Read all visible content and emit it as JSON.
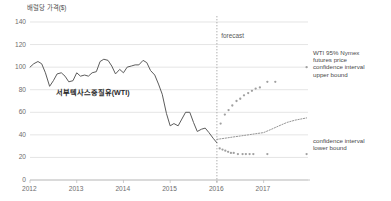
{
  "chart_data": {
    "type": "line",
    "title": "배럴당 가격($)",
    "xlabel": "",
    "ylabel": "배럴당 가격($)",
    "ylim": [
      0,
      140
    ],
    "yticks": [
      0,
      20,
      40,
      60,
      80,
      100,
      120,
      140
    ],
    "xlim": [
      2012.0,
      2017.95
    ],
    "xticks": [
      2012,
      2013,
      2014,
      2015,
      2016,
      2017
    ],
    "xticklabels": [
      "2012",
      "2013",
      "2014",
      "2015",
      "2016",
      "2017"
    ],
    "grid": true,
    "legend_position": "inline-annotations",
    "annotations": [
      {
        "name": "forecast-divider-label",
        "text": "forecast",
        "x": 2016.05,
        "y": 128
      },
      {
        "name": "wti-series-label",
        "text": "서부텍사스중질유(WTI)",
        "x": 2012.55,
        "y": 78
      },
      {
        "name": "upper-bound-label",
        "text": "WTI 95% Nymex\nfutures price\nconfidence interval\nupper bound",
        "x": 2018.05,
        "y": 104
      },
      {
        "name": "lower-bound-label",
        "text": "confidence interval\nlower bound",
        "x": 2018.05,
        "y": 26
      }
    ],
    "forecast_divider_x": 2016.0,
    "series": [
      {
        "name": "서부텍사스중질유(WTI)",
        "style": "solid-line",
        "color": "#5c5c5c",
        "x": [
          2012.0,
          2012.08,
          2012.17,
          2012.25,
          2012.33,
          2012.42,
          2012.5,
          2012.58,
          2012.67,
          2012.75,
          2012.83,
          2012.92,
          2013.0,
          2013.08,
          2013.17,
          2013.25,
          2013.33,
          2013.42,
          2013.5,
          2013.58,
          2013.67,
          2013.75,
          2013.83,
          2013.92,
          2014.0,
          2014.08,
          2014.17,
          2014.25,
          2014.33,
          2014.42,
          2014.5,
          2014.58,
          2014.67,
          2014.75,
          2014.83,
          2014.92,
          2015.0,
          2015.08,
          2015.17,
          2015.25,
          2015.33,
          2015.42,
          2015.5,
          2015.58,
          2015.67,
          2015.75,
          2015.83,
          2015.92,
          2016.0
        ],
        "values": [
          100,
          103,
          105,
          103,
          95,
          83,
          88,
          94,
          95,
          92,
          87,
          88,
          95,
          92,
          93,
          92,
          95,
          96,
          105,
          107,
          106,
          101,
          94,
          98,
          95,
          100,
          101,
          102,
          102,
          106,
          104,
          97,
          93,
          85,
          76,
          59,
          48,
          50,
          48,
          54,
          60,
          60,
          51,
          43,
          45,
          46,
          42,
          37,
          33
        ]
      },
      {
        "name": "WTI 95% Nymex futures price confidence interval upper bound",
        "style": "dots",
        "color": "#a0a0a0",
        "x": [
          2016.08,
          2016.17,
          2016.25,
          2016.33,
          2016.42,
          2016.5,
          2016.58,
          2016.67,
          2016.75,
          2016.83,
          2016.92,
          2017.08,
          2017.25,
          2017.92
        ],
        "values": [
          50,
          58,
          62,
          66,
          70,
          72,
          75,
          77,
          79,
          81,
          82,
          87,
          87,
          100
        ]
      },
      {
        "name": "confidence interval lower bound",
        "style": "dots",
        "color": "#a0a0a0",
        "x": [
          2016.06,
          2016.12,
          2016.18,
          2016.24,
          2016.3,
          2016.36,
          2016.45,
          2016.55,
          2016.62,
          2016.7,
          2016.78,
          2017.08,
          2017.92
        ],
        "values": [
          28,
          27,
          26,
          25,
          24,
          24,
          23,
          23,
          23,
          23,
          23,
          23,
          23
        ]
      },
      {
        "name": "central forecast",
        "style": "dotted-line",
        "color": "#8a8a8a",
        "x": [
          2016.0,
          2016.17,
          2016.33,
          2016.5,
          2016.67,
          2016.83,
          2017.0,
          2017.17,
          2017.33,
          2017.5,
          2017.67,
          2017.92
        ],
        "values": [
          36,
          37,
          38,
          39,
          40,
          41,
          42,
          45,
          48,
          51,
          53,
          55
        ]
      }
    ]
  }
}
